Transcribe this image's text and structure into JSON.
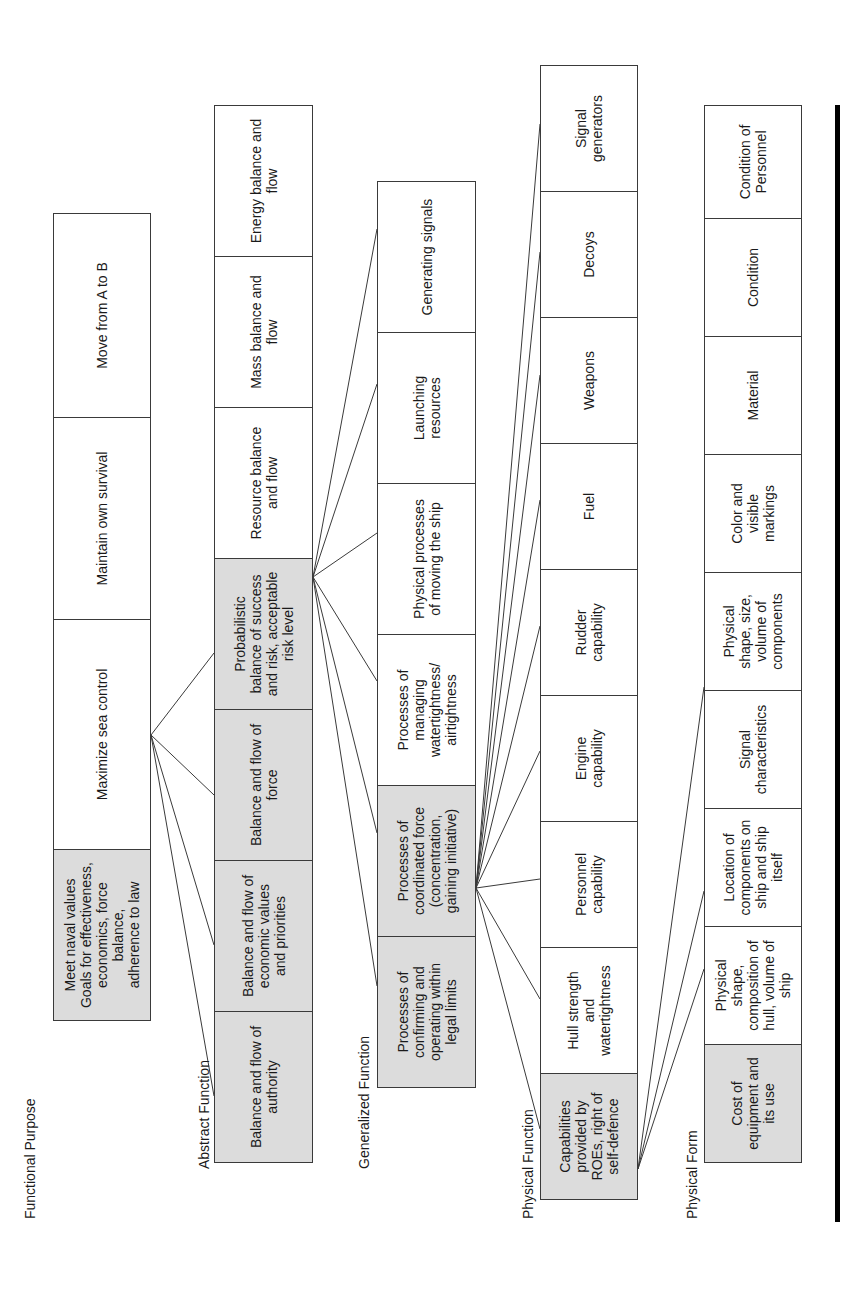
{
  "levels": [
    {
      "label": "Functional Purpose",
      "boxes": [
        {
          "text": "Meet naval values\nGoals for effectiveness,\neconomics, force balance,\nadherence to law",
          "shaded": true
        },
        {
          "text": "Maximize sea control",
          "shaded": false
        },
        {
          "text": "Maintain own survival",
          "shaded": false
        },
        {
          "text": "Move from A to B",
          "shaded": false
        }
      ]
    },
    {
      "label": "Abstract Function",
      "boxes": [
        {
          "text": "Balance and flow of\nauthority",
          "shaded": true
        },
        {
          "text": "Balance and flow of\neconomic values\nand priorities",
          "shaded": true
        },
        {
          "text": "Balance and flow of\nforce",
          "shaded": true
        },
        {
          "text": "Probabilistic\nbalance of success\nand risk, acceptable\nrisk level",
          "shaded": true
        },
        {
          "text": "Resource balance\nand flow",
          "shaded": false
        },
        {
          "text": "Mass balance and\nflow",
          "shaded": false
        },
        {
          "text": "Energy balance and\nflow",
          "shaded": false
        }
      ]
    },
    {
      "label": "Generalized Function",
      "boxes": [
        {
          "text": "Processes of\nconfirming and\noperating within\nlegal limits",
          "shaded": true
        },
        {
          "text": "Processes of\ncoordinated force\n(concentration,\ngaining initiative)",
          "shaded": true
        },
        {
          "text": "Processes of\nmanaging\nwatertightness/\nairtightness",
          "shaded": false
        },
        {
          "text": "Physical processes\nof moving the ship",
          "shaded": false
        },
        {
          "text": "Launching\nresources",
          "shaded": false
        },
        {
          "text": "Generating signals",
          "shaded": false
        }
      ]
    },
    {
      "label": "Physical Function",
      "boxes": [
        {
          "text": "Capabilities\nprovided by\nROEs, right of\nself-defence",
          "shaded": true
        },
        {
          "text": "Hull strength\nand\nwatertightness",
          "shaded": false
        },
        {
          "text": "Personnel\ncapability",
          "shaded": false
        },
        {
          "text": "Engine\ncapability",
          "shaded": false
        },
        {
          "text": "Rudder\ncapability",
          "shaded": false
        },
        {
          "text": "Fuel",
          "shaded": false
        },
        {
          "text": "Weapons",
          "shaded": false
        },
        {
          "text": "Decoys",
          "shaded": false
        },
        {
          "text": "Signal\ngenerators",
          "shaded": false
        }
      ]
    },
    {
      "label": "Physical Form",
      "boxes": [
        {
          "text": "Cost of\nequipment and\nits use",
          "shaded": true
        },
        {
          "text": "Physical\nshape,\ncomposition of\nhull, volume of\nship",
          "shaded": false
        },
        {
          "text": "Location of\ncomponents on\nship and ship\nitself",
          "shaded": false
        },
        {
          "text": "Signal\ncharacteristics",
          "shaded": false
        },
        {
          "text": "Physical\nshape, size,\nvolume of\ncomponents",
          "shaded": false
        },
        {
          "text": "Color and\nvisible\nmarkings",
          "shaded": false
        },
        {
          "text": "Material",
          "shaded": false
        },
        {
          "text": "Condition",
          "shaded": false
        },
        {
          "text": "Condition of\nPersonnel",
          "shaded": false
        }
      ]
    }
  ],
  "connections": [
    {
      "from": "Maximize sea control",
      "to": [
        "Balance and flow of authority",
        "Balance and flow of economic values and priorities",
        "Balance and flow of force",
        "Probabilistic balance of success and risk, acceptable risk level"
      ]
    },
    {
      "from": "Probabilistic balance of success and risk, acceptable risk level",
      "to": [
        "Processes of confirming and operating within legal limits",
        "Processes of coordinated force (concentration, gaining initiative)",
        "Processes of managing watertightness/airtightness",
        "Physical processes of moving the ship",
        "Launching resources",
        "Generating signals"
      ]
    },
    {
      "from": "Processes of coordinated force (concentration, gaining initiative)",
      "to": [
        "Capabilities provided by ROEs, right of self-defence",
        "Hull strength and watertightness",
        "Personnel capability",
        "Engine capability",
        "Rudder capability",
        "Fuel",
        "Weapons",
        "Decoys",
        "Signal generators"
      ]
    },
    {
      "from": "Capabilities provided by ROEs, right of self-defence",
      "to": [
        "Location of components on ship and ship itself",
        "Signal characteristics",
        "Color and visible markings"
      ]
    }
  ]
}
